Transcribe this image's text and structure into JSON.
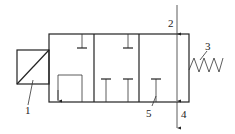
{
  "diagram": {
    "title": "",
    "type": "solenoid valve schematic",
    "labels": [
      {
        "id": "1",
        "text": "1",
        "meaning": "solenoid"
      },
      {
        "id": "2",
        "text": "2",
        "meaning": "inlet port"
      },
      {
        "id": "3",
        "text": "3",
        "meaning": "spring"
      },
      {
        "id": "4",
        "text": "4",
        "meaning": "outlet port"
      },
      {
        "id": "5",
        "text": "5",
        "meaning": "blocked port"
      }
    ],
    "colors": {
      "line": "#222222",
      "background": "#ffffff"
    }
  }
}
